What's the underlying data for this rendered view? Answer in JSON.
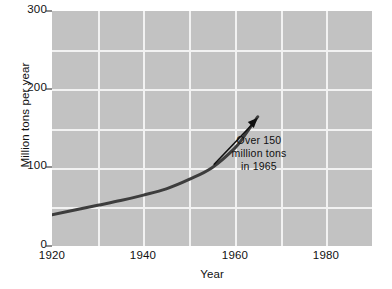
{
  "chart_data": {
    "type": "line",
    "title": "",
    "xlabel": "Year",
    "ylabel": "Million tons per year",
    "xlim": [
      1920,
      1990
    ],
    "ylim": [
      0,
      300
    ],
    "xticks": [
      "1920",
      "1940",
      "1960",
      "1980"
    ],
    "xtick_values": [
      1920,
      1940,
      1960,
      1980
    ],
    "yticks": [
      "0",
      "100",
      "200",
      "300"
    ],
    "ytick_values": [
      0,
      100,
      200,
      300
    ],
    "grid": "on",
    "x_gridlines": [
      1930,
      1940,
      1950,
      1960,
      1970,
      1980
    ],
    "y_gridlines": [
      50,
      100,
      150,
      200,
      250
    ],
    "legend": "none",
    "series": [
      {
        "name": "Production",
        "color": "#3d3d3d",
        "x": [
          1920,
          1925,
          1930,
          1935,
          1940,
          1945,
          1950,
          1955,
          1960,
          1962,
          1965
        ],
        "values": [
          40,
          46,
          52,
          58,
          65,
          73,
          85,
          100,
          125,
          140,
          165
        ]
      }
    ],
    "annotations": [
      {
        "name": "peak-callout",
        "lines": [
          "Over 150",
          "million tons",
          "in 1965"
        ],
        "points_to_x": 1965,
        "points_to_y": 165
      }
    ]
  },
  "axes": {
    "ylabel": "Million tons per year",
    "xlabel": "Year",
    "ytick_labels": [
      "300",
      "200",
      "100",
      "0"
    ],
    "xtick_labels": [
      "1920",
      "1940",
      "1960",
      "1980"
    ]
  },
  "annotation": {
    "line1": "Over 150",
    "line2": "million tons",
    "line3": "in 1965"
  },
  "colors": {
    "plot_background": "#c2c2c2",
    "gridline": "#f2f2f2",
    "series_line": "#3d3d3d",
    "text": "#111111",
    "page_background": "#ffffff"
  }
}
